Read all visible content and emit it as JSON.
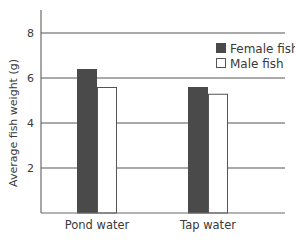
{
  "chart_data": {
    "type": "bar",
    "title": "",
    "xlabel": "",
    "ylabel": "Average fish weight (g)",
    "ylim": [
      0,
      9
    ],
    "yticks": [
      2,
      4,
      6,
      8
    ],
    "grid": true,
    "legend_position": "upper right",
    "categories": [
      "Pond water",
      "Tap water"
    ],
    "series": [
      {
        "name": "Female fish",
        "color": "#4a4a4a",
        "values": [
          6.4,
          5.6
        ]
      },
      {
        "name": "Male fish",
        "color": "#ffffff",
        "values": [
          5.6,
          5.3
        ]
      }
    ]
  },
  "colors": {
    "axis": "#6b6b6b",
    "grid": "#555555",
    "text": "#3a3a3a",
    "bar_outline": "#555555"
  }
}
